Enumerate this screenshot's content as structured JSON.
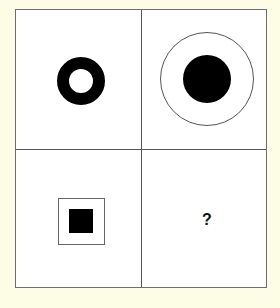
{
  "puzzle": {
    "type": "analogy-2x2-grid",
    "cells": [
      {
        "position": "top-left",
        "figure": "thick black ring"
      },
      {
        "position": "top-right",
        "figure": "black disc inside thin outline circle"
      },
      {
        "position": "bottom-left",
        "figure": "black square inside thin outline square"
      },
      {
        "position": "bottom-right",
        "figure": "unknown",
        "label": "?"
      }
    ],
    "colors": {
      "background": "#fdfde6",
      "panel": "#ffffff",
      "border": "#555555",
      "fill": "#000000"
    }
  }
}
